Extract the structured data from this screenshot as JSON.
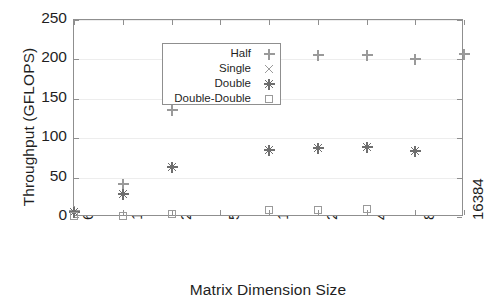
{
  "chart_data": {
    "type": "scatter",
    "title": "",
    "xlabel": "Matrix Dimension Size",
    "ylabel": "Throughput (GFLOPS)",
    "x_tick_labels": [
      "64",
      "128",
      "256",
      "512",
      "1024",
      "2048",
      "4096",
      "8192",
      "16384"
    ],
    "y_tick_labels": [
      "0",
      "50",
      "100",
      "150",
      "200",
      "250"
    ],
    "y_ticks": [
      0,
      50,
      100,
      150,
      200,
      250
    ],
    "ylim": [
      0,
      250
    ],
    "x_scale": "log2-categorical",
    "grid": "horizontal-only",
    "legend_position": "upper-left-inside",
    "series": [
      {
        "name": "Half",
        "marker": "plus",
        "x": [
          "64",
          "128",
          "256",
          "1024",
          "2048",
          "4096",
          "8192",
          "16384"
        ],
        "values": [
          8,
          42,
          136,
          199,
          205,
          206,
          200,
          207
        ]
      },
      {
        "name": "Single",
        "marker": "cross",
        "x": [],
        "values": []
      },
      {
        "name": "Double",
        "marker": "asterisk",
        "x": [
          "64",
          "128",
          "256",
          "1024",
          "2048",
          "4096",
          "8192"
        ],
        "values": [
          6,
          29,
          64,
          85,
          88,
          89,
          84
        ]
      },
      {
        "name": "Double-Double",
        "marker": "square",
        "x": [
          "64",
          "128",
          "256",
          "1024",
          "2048",
          "4096"
        ],
        "values": [
          1,
          1,
          4,
          9,
          9,
          10
        ]
      }
    ],
    "legend_entries": [
      {
        "label": "Half",
        "marker": "plus"
      },
      {
        "label": "Single",
        "marker": "cross"
      },
      {
        "label": "Double",
        "marker": "asterisk"
      },
      {
        "label": "Double-Double",
        "marker": "square"
      }
    ],
    "colors": {
      "marker": "#9a9a9a",
      "marker_dark": "#6e6e6e",
      "frame": "#8f8f8f",
      "gridline": "#ededed",
      "text": "#1f1f1f",
      "background": "#ffffff"
    }
  }
}
